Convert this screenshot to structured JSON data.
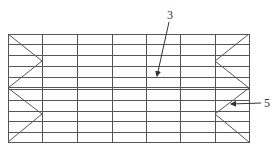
{
  "diagram": {
    "type": "grid-frame-with-v-braces",
    "colors": {
      "line": "#555555",
      "background": "#ffffff",
      "label": "#333333"
    },
    "frame": {
      "left": 8,
      "right": 249,
      "top": 34,
      "bottom": 142
    },
    "vertical_lines_x": [
      8,
      42,
      77,
      112,
      146,
      180,
      215,
      249
    ],
    "horizontal_lines_y": [
      34,
      44,
      55,
      66,
      77,
      87,
      89,
      100,
      111,
      121,
      132,
      142
    ],
    "v_braces": [
      {
        "side": "left",
        "points": [
          [
            8,
            34
          ],
          [
            42,
            61
          ],
          [
            8,
            88
          ]
        ]
      },
      {
        "side": "left",
        "points": [
          [
            8,
            88
          ],
          [
            42,
            114
          ],
          [
            8,
            142
          ]
        ]
      },
      {
        "side": "right",
        "points": [
          [
            249,
            34
          ],
          [
            215,
            61
          ],
          [
            249,
            88
          ]
        ]
      },
      {
        "side": "right",
        "points": [
          [
            249,
            88
          ],
          [
            215,
            114
          ],
          [
            249,
            142
          ]
        ]
      }
    ],
    "callouts": [
      {
        "id": "callout-3",
        "text": "3",
        "label_x": 167,
        "label_y": 9,
        "line_from": [
          169,
          22
        ],
        "line_to": [
          157,
          76
        ]
      },
      {
        "id": "callout-5",
        "text": "5",
        "label_x": 264,
        "label_y": 97,
        "line_from": [
          261,
          103
        ],
        "line_to": [
          231,
          104
        ]
      }
    ]
  }
}
